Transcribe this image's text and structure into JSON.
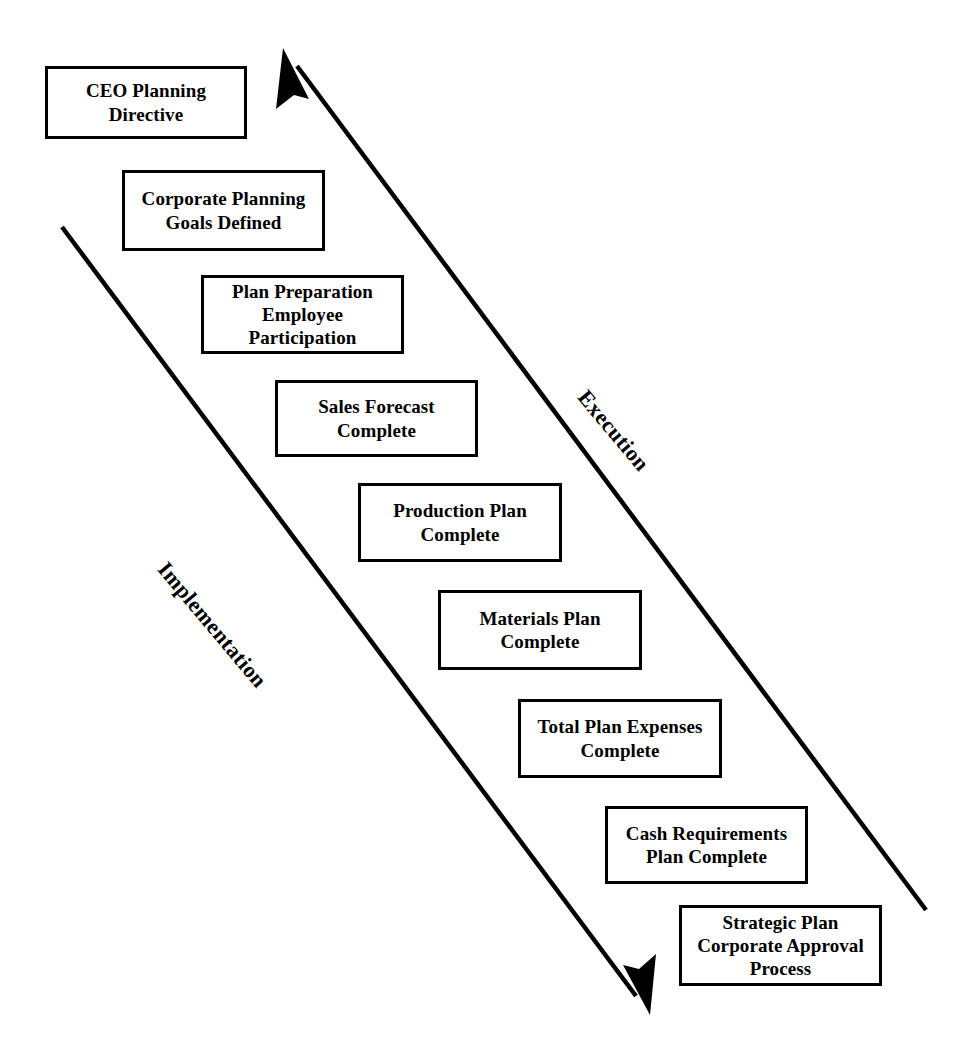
{
  "diagram": {
    "type": "cascading-milestone-diagram",
    "background_color": "#ffffff",
    "line_color": "#000000",
    "box_border_color": "#000000",
    "box_fill_color": "#ffffff"
  },
  "axis_labels": [
    {
      "name": "execution-label",
      "text": "Execution",
      "orientation": "rotated-diagonal-descending",
      "angle_deg": 50
    },
    {
      "name": "implementation-label",
      "text": "Implementation",
      "orientation": "rotated-diagonal-descending",
      "angle_deg": 50
    }
  ],
  "arrows": [
    {
      "name": "execution-arrow",
      "direction": "up-left",
      "from": [
        926,
        910
      ],
      "to": [
        283,
        48
      ],
      "arrowhead_at": "end"
    },
    {
      "name": "implementation-arrow",
      "direction": "down-right",
      "from": [
        62,
        227
      ],
      "to": [
        650,
        1015
      ],
      "arrowhead_at": "end"
    }
  ],
  "milestones": [
    {
      "id": 1,
      "label": "CEO Planning\nDirective",
      "x": 45,
      "y": 66,
      "w": 202,
      "h": 73
    },
    {
      "id": 2,
      "label": "Corporate Planning\nGoals Defined",
      "x": 122,
      "y": 170,
      "w": 203,
      "h": 81
    },
    {
      "id": 3,
      "label": "Plan Preparation\nEmployee\nParticipation",
      "x": 201,
      "y": 275,
      "w": 203,
      "h": 79
    },
    {
      "id": 4,
      "label": "Sales Forecast\nComplete",
      "x": 275,
      "y": 380,
      "w": 203,
      "h": 77
    },
    {
      "id": 5,
      "label": "Production Plan\nComplete",
      "x": 358,
      "y": 483,
      "w": 204,
      "h": 79
    },
    {
      "id": 6,
      "label": "Materials Plan\nComplete",
      "x": 438,
      "y": 590,
      "w": 204,
      "h": 80
    },
    {
      "id": 7,
      "label": "Total Plan Expenses\nComplete",
      "x": 518,
      "y": 699,
      "w": 204,
      "h": 79
    },
    {
      "id": 8,
      "label": "Cash Requirements\nPlan Complete",
      "x": 605,
      "y": 806,
      "w": 203,
      "h": 78
    },
    {
      "id": 9,
      "label": "Strategic Plan\nCorporate Approval\nProcess",
      "x": 679,
      "y": 905,
      "w": 203,
      "h": 81
    }
  ]
}
